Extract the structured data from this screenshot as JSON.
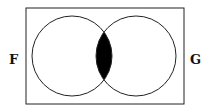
{
  "diagram": {
    "type": "venn",
    "universe": "rectangle",
    "sets": [
      {
        "label": "F",
        "position": "left"
      },
      {
        "label": "G",
        "position": "right"
      }
    ],
    "shaded_region": "F ∩ G",
    "shade_color": "#000000",
    "line_color": "#222222"
  }
}
